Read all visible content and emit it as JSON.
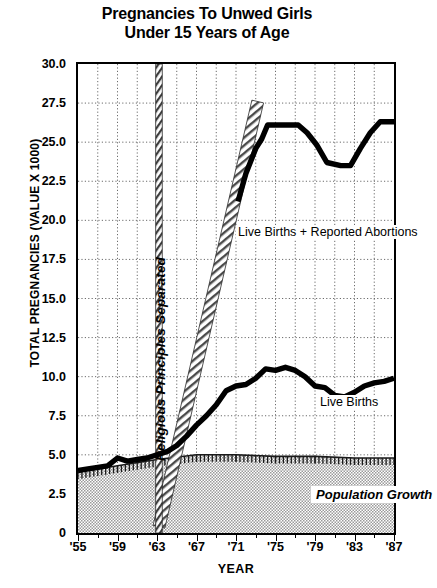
{
  "chart_data": {
    "type": "line",
    "title": "Pregnancies To Unwed Girls Under 15 Years of Age",
    "title_line1": "Pregnancies To Unwed Girls",
    "title_line2": "Under 15 Years of Age",
    "xlabel": "YEAR",
    "ylabel": "TOTAL PREGNANCIES (VALUE X 1000)",
    "xlim": [
      1955,
      1987
    ],
    "ylim": [
      0,
      30
    ],
    "ytick_labels": [
      "30.0",
      "27.5",
      "25.0",
      "22.5",
      "20.0",
      "17.5",
      "15.0",
      "12.5",
      "10.0",
      "7.5",
      "5.0",
      "2.5",
      "0"
    ],
    "ytick_values": [
      30,
      27.5,
      25,
      22.5,
      20,
      17.5,
      15,
      12.5,
      10,
      7.5,
      5,
      2.5,
      0
    ],
    "xtick_labels": [
      "'55",
      "'59",
      "'63",
      "'67",
      "'71",
      "'75",
      "'79",
      "'83",
      "'87"
    ],
    "xtick_values": [
      1955,
      1959,
      1963,
      1967,
      1971,
      1975,
      1979,
      1983,
      1987
    ],
    "grid": true,
    "grid_x_step": 2,
    "grid_y_step": 2.5,
    "legend_position": "inline-annotations",
    "series": [
      {
        "name": "Live Births + Reported Abortions",
        "style": "thick-solid-black",
        "x": [
          1971.2,
          1972.0,
          1973.0,
          1973.6,
          1974.2,
          1977.3,
          1978.2,
          1979.2,
          1980.2,
          1981.6,
          1982.6,
          1983.6,
          1984.6,
          1985.6,
          1987.0
        ],
        "y": [
          21.2,
          23.0,
          24.6,
          25.2,
          26.1,
          26.1,
          25.6,
          24.8,
          23.7,
          23.5,
          23.5,
          24.6,
          25.6,
          26.3,
          26.3
        ]
      },
      {
        "name": "Live Births",
        "style": "thick-solid-black",
        "x": [
          1955,
          1956,
          1957,
          1958,
          1959,
          1960,
          1961,
          1962,
          1963,
          1964,
          1965,
          1966,
          1967,
          1968,
          1969,
          1970,
          1971,
          1972,
          1973,
          1974,
          1975,
          1976,
          1977,
          1978,
          1979,
          1980,
          1981,
          1982,
          1983,
          1984,
          1985,
          1986,
          1987
        ],
        "y": [
          4.0,
          4.1,
          4.2,
          4.3,
          4.8,
          4.6,
          4.7,
          4.8,
          5.0,
          5.2,
          5.6,
          6.2,
          6.9,
          7.5,
          8.2,
          9.1,
          9.4,
          9.5,
          9.9,
          10.5,
          10.4,
          10.6,
          10.4,
          10.0,
          9.4,
          9.3,
          8.8,
          8.7,
          9.0,
          9.4,
          9.6,
          9.7,
          9.9
        ]
      },
      {
        "name": "Reported Abortions",
        "style": "diagonal-hatched-band",
        "x": [
          1963.2,
          1973.2
        ],
        "y": [
          0.4,
          27.6
        ]
      },
      {
        "name": "Population Growth",
        "style": "gray-stipple-area",
        "x": [
          1955,
          1959,
          1963,
          1967,
          1971,
          1975,
          1979,
          1983,
          1987
        ],
        "y": [
          3.9,
          4.3,
          4.7,
          5.0,
          5.0,
          4.9,
          4.9,
          4.8,
          4.8
        ]
      }
    ],
    "annotations": [
      {
        "id": "ann-lbra",
        "text": "Live Births + Reported Abortions",
        "x": 1974.5,
        "y": 19.2
      },
      {
        "id": "ann-lb",
        "text": "Live Births",
        "x": 1980.0,
        "y": 7.9
      },
      {
        "id": "ann-pg",
        "text": "Population Growth",
        "x": 1980.5,
        "y": 2.0
      },
      {
        "id": "ann-rps",
        "text": "Religious Principles Separated",
        "x": 1963,
        "y": 16.0,
        "orientation": "vertical"
      }
    ],
    "colors": {
      "line": "#000000",
      "grid": "#6b6b6b",
      "axis": "#000000",
      "area_fill": "#c8c8c8",
      "background": "#ffffff"
    }
  }
}
